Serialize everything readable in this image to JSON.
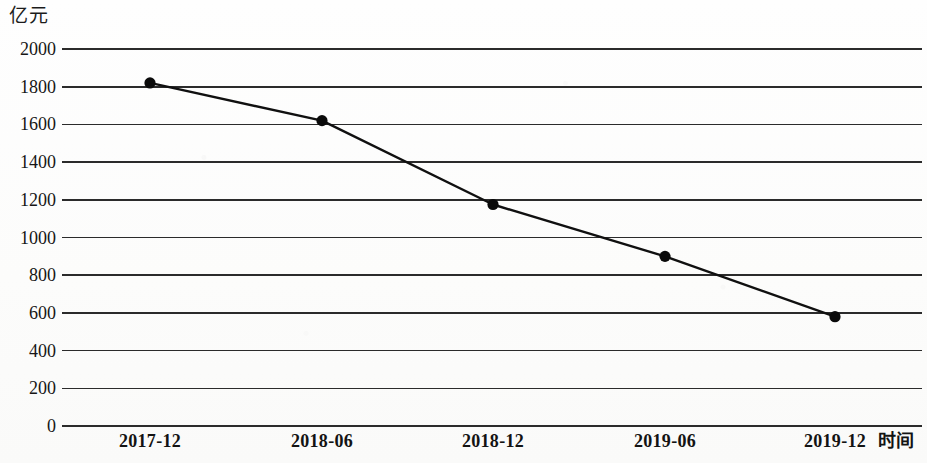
{
  "chart_data": {
    "type": "line",
    "title": "",
    "unit_label": "亿元",
    "xlabel": "时间",
    "ylabel": "",
    "categories": [
      "2017-12",
      "2018-06",
      "2018-12",
      "2019-06",
      "2019-12"
    ],
    "values": [
      1820,
      1620,
      1175,
      900,
      580
    ],
    "series": [
      {
        "name": "",
        "values": [
          1820,
          1620,
          1175,
          900,
          580
        ]
      }
    ],
    "ylim": [
      0,
      2000
    ],
    "ytick_labels": [
      "2000",
      "1800",
      "1600",
      "1400",
      "1200",
      "1000",
      "800",
      "600",
      "400",
      "200",
      "0"
    ],
    "ytick_values": [
      2000,
      1800,
      1600,
      1400,
      1200,
      1000,
      800,
      600,
      400,
      200,
      0
    ],
    "ytick_step": 200,
    "grid": true,
    "grid_orientation": "horizontal",
    "legend": "none",
    "marker": "filled-circle",
    "line_color": "#101010",
    "grid_color": "#2b2b2b",
    "marker_color": "#0a0a0a",
    "background_color": "#fdfdfc"
  },
  "geometry": {
    "plot_left": 62,
    "plot_right": 922,
    "y_top_px": 49,
    "y_bottom_px": 426,
    "point_x_px": [
      150,
      322,
      493,
      665,
      835
    ],
    "point_y_px": [
      85,
      122,
      208,
      257,
      319
    ],
    "marker_radius": 5.6,
    "line_width": 2.4,
    "grid_width": 1.6
  }
}
